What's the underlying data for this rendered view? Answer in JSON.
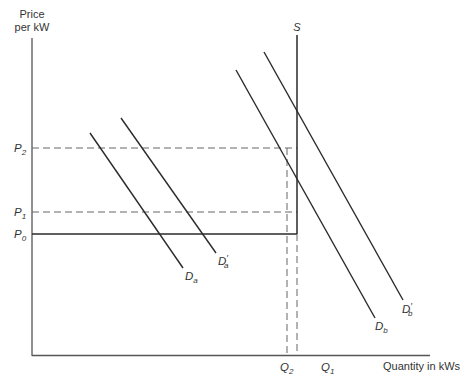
{
  "diagram": {
    "type": "supply-demand",
    "axes": {
      "y_label_line1": "Price",
      "y_label_line2": "per kW",
      "x_label": "Quantity in kWs"
    },
    "price_levels": [
      {
        "name": "P2",
        "base": "P",
        "sub": "2",
        "y": 148,
        "style": "dashed"
      },
      {
        "name": "P1",
        "base": "P",
        "sub": "1",
        "y": 212,
        "style": "dashed"
      },
      {
        "name": "P0",
        "base": "P",
        "sub": "0",
        "y": 234,
        "style": "solid"
      }
    ],
    "quantity_levels": [
      {
        "name": "Q2",
        "base": "Q",
        "sub": "2",
        "x": 287
      },
      {
        "name": "Q1",
        "base": "Q",
        "sub": "1",
        "x": 297
      }
    ],
    "curves": [
      {
        "name": "S",
        "label": "S"
      },
      {
        "name": "Da",
        "base": "D",
        "sub": "a",
        "prime": ""
      },
      {
        "name": "D'a",
        "base": "D",
        "sub": "a",
        "prime": "′"
      },
      {
        "name": "Db",
        "base": "D",
        "sub": "b",
        "prime": ""
      },
      {
        "name": "D'b",
        "base": "D",
        "sub": "b",
        "prime": "′"
      }
    ],
    "colors": {
      "line": "#2a2a2a",
      "axis": "#555555",
      "dash": "#666666",
      "text": "#333333"
    }
  }
}
